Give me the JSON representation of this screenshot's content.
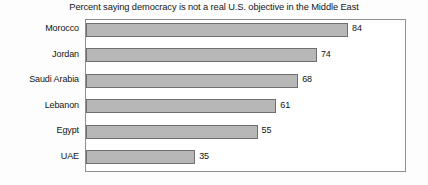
{
  "chart_data": {
    "type": "bar",
    "orientation": "horizontal",
    "title": "Percent saying democracy is not a real U.S. objective in the Middle East",
    "xlabel": "",
    "ylabel": "",
    "xlim": [
      0,
      100
    ],
    "grid": false,
    "legend": null,
    "categories": [
      "Morocco",
      "Jordan",
      "Saudi Arabia",
      "Lebanon",
      "Egypt",
      "UAE"
    ],
    "values": [
      84,
      74,
      68,
      61,
      55,
      35
    ],
    "value_labels": [
      "84",
      "74",
      "68",
      "61",
      "55",
      "35"
    ],
    "series": [
      {
        "name": "Percent",
        "values": [
          84,
          74,
          68,
          61,
          55,
          35
        ]
      }
    ],
    "colors": {
      "bar_fill": "#b7b7b7",
      "bar_border": "#6f6f6f",
      "frame": "#8e8e8e",
      "text": "#141414",
      "background": "#fdfdfd"
    }
  }
}
